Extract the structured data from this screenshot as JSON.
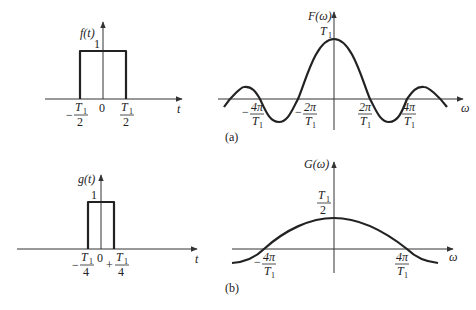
{
  "panels": {
    "a": {
      "label": "(a)",
      "time": {
        "ylabel": "f(t)",
        "xlabel": "t",
        "amplitude_label": "1",
        "origin_label": "0",
        "left_edge": {
          "sign": "−",
          "num": "T",
          "sub": "1",
          "den": "2"
        },
        "right_edge": {
          "sign": "",
          "num": "T",
          "sub": "1",
          "den": "2"
        }
      },
      "freq": {
        "ylabel": "F(ω)",
        "xlabel": "ω",
        "peak": {
          "main": "T",
          "sub": "1"
        },
        "ticks": [
          {
            "sign": "−",
            "num": "4π",
            "den_main": "T",
            "den_sub": "1"
          },
          {
            "sign": "−",
            "num": "2π",
            "den_main": "T",
            "den_sub": "1"
          },
          {
            "sign": "",
            "num": "2π",
            "den_main": "T",
            "den_sub": "1"
          },
          {
            "sign": "",
            "num": "4π",
            "den_main": "T",
            "den_sub": "1"
          }
        ]
      }
    },
    "b": {
      "label": "(b)",
      "time": {
        "ylabel": "g(t)",
        "xlabel": "t",
        "amplitude_label": "1",
        "origin_label": "0",
        "left_edge": {
          "sign": "−",
          "num": "T",
          "sub": "1",
          "den": "4"
        },
        "right_edge": {
          "sign": "+",
          "num": "T",
          "sub": "1",
          "den": "4"
        }
      },
      "freq": {
        "ylabel": "G(ω)",
        "xlabel": "ω",
        "peak": {
          "num_main": "T",
          "num_sub": "1",
          "den": "2"
        },
        "ticks": [
          {
            "sign": "−",
            "num": "4π",
            "den_main": "T",
            "den_sub": "1"
          },
          {
            "sign": "",
            "num": "4π",
            "den_main": "T",
            "den_sub": "1"
          }
        ]
      }
    }
  },
  "colors": {
    "ink": "#222222",
    "background": "#ffffff"
  }
}
